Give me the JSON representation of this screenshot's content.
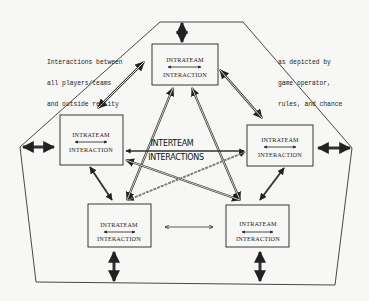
{
  "diagram": {
    "title": "",
    "annotations": {
      "left": [
        "Interactions between",
        "all players/teams",
        "and outside reality"
      ],
      "right": [
        "as depicted by",
        "game operator,",
        "rules, and chance"
      ]
    },
    "center_label": {
      "line1": "INTERTEAM",
      "line2": "INTERACTIONS"
    },
    "boxes": [
      {
        "id": "top",
        "line1": "INTRATEAM",
        "line2": "INTERACTION"
      },
      {
        "id": "left",
        "line1": "INTRATEAM",
        "line2": "INTERACTION"
      },
      {
        "id": "right",
        "line1": "INTRATEAM",
        "line2": "INTERACTION"
      },
      {
        "id": "bottom-left",
        "line1": "INTRATEAM",
        "line2": "INTERACTION"
      },
      {
        "id": "bottom-right",
        "line1": "INTRATEAM",
        "line2": "INTERACTION"
      }
    ],
    "colors": {
      "ink": "#222222",
      "paper": "#f7f7f5"
    }
  }
}
